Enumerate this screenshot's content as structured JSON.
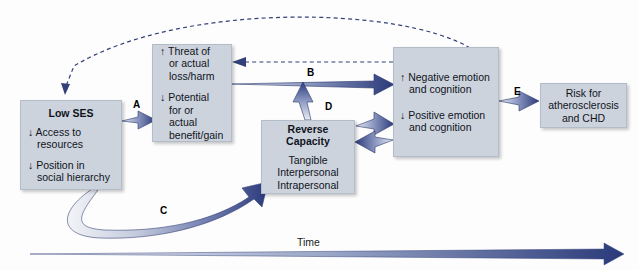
{
  "diagram": {
    "title_absent": true,
    "boxes": {
      "low_ses": {
        "title": "Low SES",
        "line1": "↓ Access to",
        "line2": "resources",
        "line3": "↓ Position in",
        "line4": "social hierarchy"
      },
      "threat": {
        "line1": "↑ Threat of",
        "line2": "or actual",
        "line3": "loss/harm",
        "line4": "↓ Potential",
        "line5": "for or actual",
        "line6": "benefit/gain"
      },
      "reverse_capacity": {
        "title": "Reverse Capacity",
        "line1": "Tangible",
        "line2": "Interpersonal",
        "line3": "Intrapersonal"
      },
      "emotion": {
        "line1": "↑ Negative emotion",
        "line2": "and cognition",
        "line3": "↓ Positive emotion",
        "line4": "and cognition"
      },
      "risk": {
        "line1": "Risk for",
        "line2": "atherosclerosis",
        "line3": "and CHD"
      }
    },
    "path_labels": {
      "a": "A",
      "b": "B",
      "c": "C",
      "d": "D",
      "e": "E"
    },
    "axis": {
      "time_label": "Time"
    },
    "colors": {
      "box_fill": "#ccd3dd",
      "box_border": "#b3bcc9",
      "arrow_dark": "#2a3a7a",
      "arrow_light": "#e3e7ee",
      "text": "#10131c",
      "dashed": "#33407a"
    }
  }
}
